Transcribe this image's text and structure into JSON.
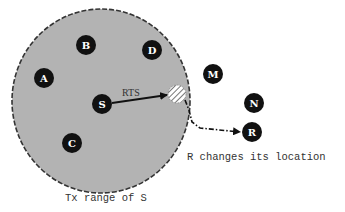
{
  "diagram": {
    "type": "wireless-network-transmission-range",
    "range_region": {
      "label": "Tx range of S",
      "center": [
        101,
        101
      ],
      "rx": 89,
      "ry": 92,
      "fill": "#b3b3b3",
      "stroke": "#333333"
    },
    "nodes": [
      {
        "id": "A",
        "x": 44,
        "y": 78,
        "inside_range": true
      },
      {
        "id": "B",
        "x": 86,
        "y": 45,
        "inside_range": true
      },
      {
        "id": "D",
        "x": 152,
        "y": 50,
        "inside_range": true
      },
      {
        "id": "S",
        "x": 102,
        "y": 104,
        "inside_range": true,
        "role": "sender"
      },
      {
        "id": "C",
        "x": 72,
        "y": 143,
        "inside_range": true
      },
      {
        "id": "M",
        "x": 213,
        "y": 74,
        "inside_range": false
      },
      {
        "id": "N",
        "x": 254,
        "y": 103,
        "inside_range": false
      },
      {
        "id": "R",
        "x": 252,
        "y": 132,
        "inside_range": false,
        "role": "receiver"
      }
    ],
    "node_style": {
      "fill": "#111111",
      "text_color": "#ffffff",
      "radius": 10
    },
    "old_position": {
      "x": 177,
      "y": 94,
      "r": 9,
      "pattern": "hatched"
    },
    "edges": [
      {
        "from": "S",
        "to": "old_position",
        "label": "RTS",
        "style": "solid-arrow"
      },
      {
        "from": "old_position",
        "to": "R",
        "label": "",
        "style": "dash-dot-arrow"
      }
    ],
    "annotations": {
      "rts": "RTS",
      "move": "R changes its location",
      "range": "Tx range of S"
    }
  }
}
